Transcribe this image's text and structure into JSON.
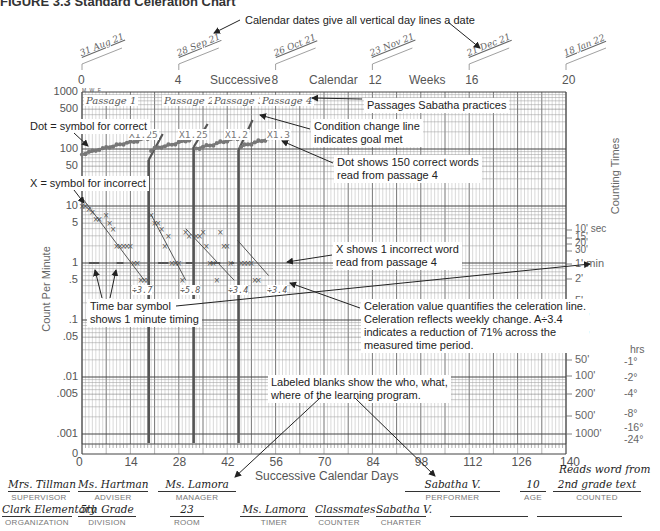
{
  "figure_title": "FIGURE 3.3 Standard Celeration Chart",
  "chart_data": {
    "type": "scatter",
    "title": "Standard Celeration Chart",
    "xlabel": "Successive Calendar Days",
    "x2label": "Successive Calendar Weeks",
    "ylabel": "Count Per Minute",
    "y2label": "Counting Times",
    "yscale": "log",
    "ylim": [
      0.001,
      1000
    ],
    "xlim": [
      0,
      140
    ],
    "x_ticks": [
      0,
      14,
      28,
      42,
      56,
      70,
      84,
      98,
      112,
      126,
      140
    ],
    "x2_ticks": [
      0,
      4,
      8,
      12,
      16,
      20
    ],
    "y_ticks": [
      "1000",
      "500",
      "100",
      "50",
      "10",
      "5",
      "1",
      ".5",
      ".1",
      ".05",
      ".01",
      ".005",
      ".001",
      "0"
    ],
    "counting_times": [
      "10' sec",
      "15'",
      "20'",
      "30'",
      "1' min",
      "2'",
      "5'",
      "10'",
      "20'",
      "50'",
      "100'",
      "200'",
      "500'",
      "1000'"
    ],
    "counting_hours": [
      "hrs",
      "-1°",
      "-2°",
      "-4°",
      "-8°",
      "-16°",
      "-24°"
    ],
    "calendar_dates": [
      "31 Aug 21",
      "28 Sep 21",
      "26 Oct 21",
      "23 Nov 21",
      "21 Dec 21",
      "18 Jan 22"
    ],
    "day_labels": [
      "M",
      "W",
      "F",
      "SUN"
    ],
    "grid": true,
    "phases": [
      {
        "name": "Passage 1",
        "start_day": 0,
        "end_day": 19,
        "correct_multiplier": "X1.25",
        "incorrect_celeration": "÷3.7"
      },
      {
        "name": "Passage 2",
        "start_day": 20,
        "end_day": 32,
        "correct_multiplier": "X1.25",
        "incorrect_celeration": "÷5.8"
      },
      {
        "name": "Passage 3",
        "start_day": 33,
        "end_day": 45,
        "correct_multiplier": "X1.2",
        "incorrect_celeration": "÷3.4"
      },
      {
        "name": "Passage 4",
        "start_day": 46,
        "end_day": 56,
        "correct_multiplier": "X1.3",
        "incorrect_celeration": "÷3.4"
      }
    ],
    "condition_change_days": [
      19,
      32,
      45
    ],
    "series": [
      {
        "name": "Correct (dots)",
        "marker": "dot",
        "x": [
          0,
          1,
          2,
          3,
          4,
          5,
          6,
          7,
          8,
          9,
          10,
          11,
          12,
          13,
          14,
          15,
          16,
          17,
          18,
          19,
          20,
          21,
          22,
          23,
          24,
          25,
          26,
          27,
          28,
          29,
          30,
          31,
          32,
          33,
          34,
          35,
          36,
          37,
          38,
          39,
          40,
          41,
          42,
          43,
          44,
          45,
          46,
          47,
          48,
          49,
          50,
          51,
          52,
          53,
          54,
          55
        ],
        "values": [
          80,
          85,
          88,
          90,
          95,
          100,
          100,
          105,
          110,
          112,
          115,
          120,
          125,
          128,
          130,
          135,
          140,
          145,
          150,
          155,
          95,
          100,
          105,
          110,
          112,
          115,
          120,
          125,
          130,
          135,
          140,
          145,
          150,
          100,
          105,
          110,
          112,
          115,
          120,
          125,
          130,
          135,
          140,
          145,
          150,
          155,
          110,
          115,
          120,
          125,
          130,
          135,
          140,
          145,
          150,
          150
        ]
      },
      {
        "name": "Incorrect (X)",
        "marker": "x",
        "x": [
          0,
          1,
          2,
          3,
          4,
          5,
          7,
          8,
          9,
          10,
          11,
          12,
          13,
          14,
          15,
          16,
          17,
          18,
          19,
          20,
          21,
          22,
          23,
          24,
          25,
          26,
          27,
          28,
          29,
          30,
          31,
          33,
          34,
          35,
          36,
          37,
          38,
          39,
          40,
          41,
          42,
          43,
          46,
          47,
          48,
          49,
          50,
          51
        ],
        "values": [
          10,
          10,
          9,
          8,
          6,
          6,
          7,
          5,
          4,
          2,
          2,
          2,
          2,
          2,
          1,
          1,
          0.5,
          0.5,
          0.5,
          7,
          5,
          5,
          4,
          2,
          3,
          1,
          1,
          1,
          0.5,
          3.5,
          3,
          3,
          3,
          3.5,
          2,
          1,
          1,
          0.5,
          3.5,
          2,
          2,
          1,
          1,
          1,
          1,
          1,
          0.5,
          0.5
        ]
      }
    ],
    "time_bar": {
      "value": 1,
      "meaning": "1 minute timing"
    }
  },
  "annotations": {
    "calendar_dates": "Calendar dates give all vertical day lines a date",
    "passages": "Passages Sabatha practices",
    "dot_symbol": "Dot = symbol for correct",
    "condition_change": [
      "Condition change line",
      "indicates goal met"
    ],
    "dot_shows": [
      "Dot shows 150 correct words",
      "read from passage 4"
    ],
    "x_symbol": "X = symbol for incorrect",
    "x_shows": [
      "X shows 1 incorrect word",
      "read from passage 4"
    ],
    "time_bar": [
      "Time bar symbol",
      "shows 1 minute timing"
    ],
    "celeration": [
      "Celeration value quantifies the celeration line.",
      "Celeration reflects weekly change. A÷3.4",
      "indicates a reduction of 71% across the",
      "measured time period."
    ],
    "labeled_blanks": [
      "Labeled blanks show the who, what,",
      "where of the learning program."
    ]
  },
  "axis_text": {
    "top_successive": "Successive",
    "top_calendar": "Calendar",
    "top_weeks": "Weeks",
    "bottom": "Successive Calendar Days",
    "left": "Count Per Minute",
    "right": "Counting Times"
  },
  "form": {
    "row1": [
      {
        "caption": "SUPERVISOR",
        "value": "Mrs. Tillman"
      },
      {
        "caption": "ADVISER",
        "value": "Ms. Hartman"
      },
      {
        "caption": "MANAGER",
        "value": "Ms. Lamora"
      },
      {
        "caption": "PERFORMER",
        "value": "Sabatha V."
      },
      {
        "caption": "AGE",
        "value": "10"
      },
      {
        "caption": "COUNTED",
        "value": "2nd grade text",
        "value_above": "Reads word from"
      }
    ],
    "row2": [
      {
        "caption": "ORGANIZATION",
        "value": "Clark Elementary"
      },
      {
        "caption": "DIVISION",
        "value": "5th Grade"
      },
      {
        "caption": "ROOM",
        "value": "23"
      },
      {
        "caption": "TIMER",
        "value": "Ms. Lamora"
      },
      {
        "caption": "COUNTER",
        "value": "Classmates"
      },
      {
        "caption": "CHARTER",
        "value": "Sabatha V."
      },
      {
        "caption": "",
        "value": ""
      },
      {
        "caption": "",
        "value": ""
      }
    ]
  }
}
